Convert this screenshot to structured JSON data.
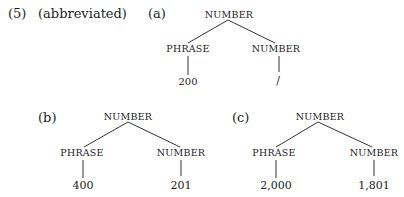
{
  "example_number": "(5)",
  "note": "(abbreviated)",
  "trees": [
    {
      "label": "(a)",
      "root": "NUMBER",
      "left": {
        "label": "PHRASE",
        "leaf": "200"
      },
      "right": {
        "label": "NUMBER",
        "leaf": "/"
      }
    },
    {
      "label": "(b)",
      "root": "NUMBER",
      "left": {
        "label": "PHRASE",
        "leaf": "400"
      },
      "right": {
        "label": "NUMBER",
        "leaf": "201"
      }
    },
    {
      "label": "(c)",
      "root": "NUMBER",
      "left": {
        "label": "PHRASE",
        "leaf": "2,000"
      },
      "right": {
        "label": "NUMBER",
        "leaf": "1,801"
      }
    }
  ]
}
